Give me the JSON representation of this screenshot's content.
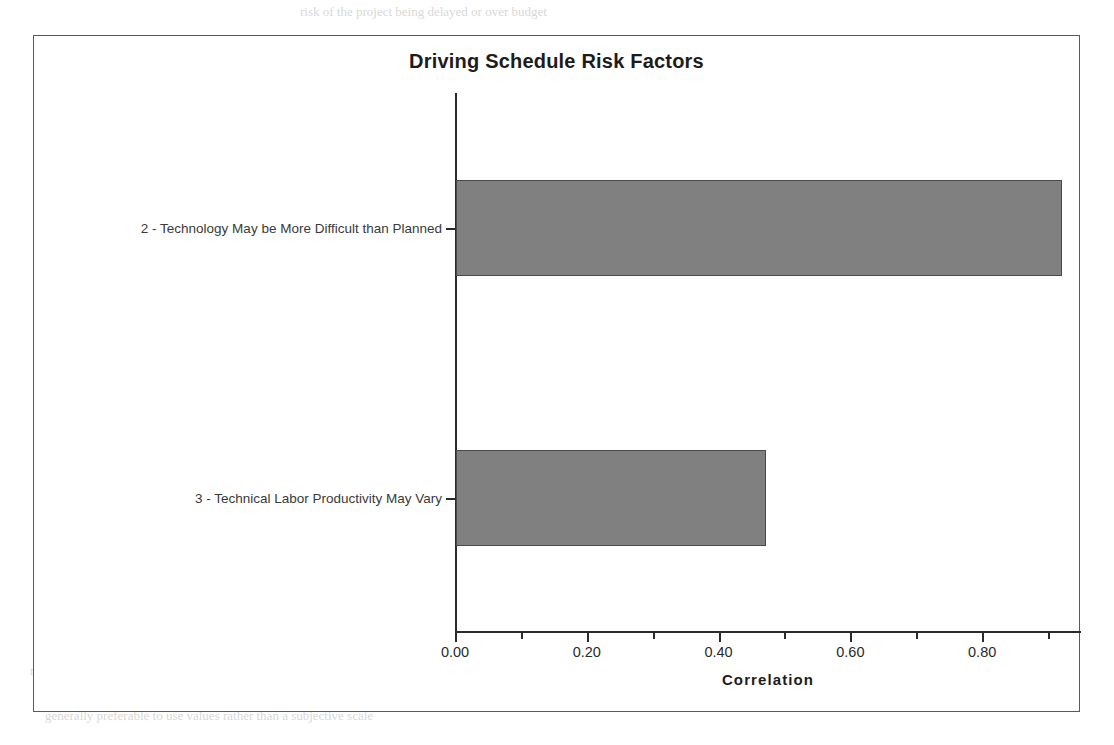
{
  "chart_data": {
    "type": "bar",
    "orientation": "horizontal",
    "title": "Driving Schedule Risk Factors",
    "xlabel": "Correlation",
    "ylabel": "",
    "categories": [
      "2 - Technology May be More Difficult than Planned",
      "3 - Technical Labor Productivity May Vary"
    ],
    "values": [
      0.92,
      0.47
    ],
    "xlim": [
      0.0,
      0.95
    ],
    "xticks": [
      0.0,
      0.2,
      0.4,
      0.6,
      0.8
    ],
    "xtick_labels": [
      "0.00",
      "0.20",
      "0.40",
      "0.60",
      "0.80"
    ],
    "xminor_ticks": [
      0.1,
      0.3,
      0.5,
      0.7,
      0.9
    ],
    "grid": false,
    "legend": null,
    "bar_color": "#808080",
    "bar_edge_color": "#4a4a4a",
    "axis_color": "#2b2b2b",
    "frame_color": "#5a5a5a",
    "background": "#ffffff"
  },
  "background_scan_text": [
    {
      "text": "risk of the project being delayed or over budget",
      "x": 300,
      "y": 4,
      "size": 13
    },
    {
      "text": "Figure 4. Example of risks selected and compared for inclusion in the simulation",
      "x": 120,
      "y": 128,
      "size": 13
    },
    {
      "text": "once the risks have been identified and assessed, the next step is",
      "x": 150,
      "y": 205,
      "size": 13
    },
    {
      "text": "procurement of long-lead equipment. The risk of a delay in delivery of",
      "x": 110,
      "y": 316,
      "size": 13
    },
    {
      "text": "drilled vessel. If so, this may be how",
      "x": 160,
      "y": 340,
      "size": 13
    },
    {
      "text": "permit from the commission and this indicates that the project may be more",
      "x": 130,
      "y": 365,
      "size": 13
    },
    {
      "text": "achieved an initial assessment of the risk in question using",
      "x": 150,
      "y": 389,
      "size": 13
    },
    {
      "text": "these factors is considered and",
      "x": 175,
      "y": 412,
      "size": 13
    },
    {
      "text": "consequence of the event and the probability of it occurring",
      "x": 155,
      "y": 436,
      "size": 13
    },
    {
      "text": "are represented on the risk register",
      "x": 190,
      "y": 460,
      "size": 13
    },
    {
      "text": "4.1 Input of the risk data",
      "x": 310,
      "y": 565,
      "size": 13
    },
    {
      "text": "A risk must be adequately described to be properly captured. An individual",
      "x": 40,
      "y": 640,
      "size": 13
    },
    {
      "text": "risk may be a combination of several events and the probability and impact",
      "x": 30,
      "y": 663,
      "size": 13
    },
    {
      "text": "may need to be considered. Where the event can be quantified, it is",
      "x": 35,
      "y": 686,
      "size": 13
    },
    {
      "text": "generally preferable to use values rather than a subjective scale",
      "x": 45,
      "y": 708,
      "size": 13
    }
  ]
}
